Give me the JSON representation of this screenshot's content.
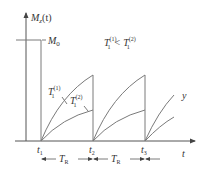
{
  "diagram": {
    "type": "mri-saturation-recovery",
    "y_axis_label": "M",
    "y_axis_label_sub": "z",
    "y_axis_label_arg": "(t)",
    "x_axis_label": "t",
    "m0_label": "M",
    "m0_sub": "0",
    "relation": {
      "lhs": "T",
      "lhs_sub": "1",
      "lhs_sup": "(1)",
      "op": "<",
      "rhs": "T",
      "rhs_sub": "1",
      "rhs_sup": "(2)"
    },
    "curve_labels": [
      {
        "main": "T",
        "sub": "1",
        "sup": "(1)"
      },
      {
        "main": "T",
        "sub": "1",
        "sup": "(2)"
      }
    ],
    "extra_label": "y",
    "time_points": [
      {
        "main": "t",
        "sub": "1"
      },
      {
        "main": "t",
        "sub": "2"
      },
      {
        "main": "t",
        "sub": "3"
      }
    ],
    "interval_label": {
      "main": "T",
      "sub": "R"
    }
  }
}
